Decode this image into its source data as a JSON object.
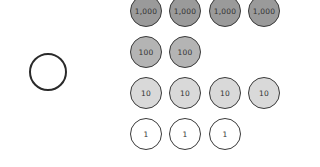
{
  "diagram": {
    "empty_circle": {
      "label": ""
    },
    "rows": [
      {
        "value": "1,000",
        "count": 4,
        "fill": "#9a9a9a"
      },
      {
        "value": "100",
        "count": 2,
        "fill": "#b4b4b4"
      },
      {
        "value": "10",
        "count": 4,
        "fill": "#d9d9d9"
      },
      {
        "value": "1",
        "count": 3,
        "fill": "#ffffff"
      }
    ],
    "coins": [
      {
        "row": 0,
        "col": 0,
        "label": "1,000"
      },
      {
        "row": 0,
        "col": 1,
        "label": "1,000"
      },
      {
        "row": 0,
        "col": 2,
        "label": "1,000"
      },
      {
        "row": 0,
        "col": 3,
        "label": "1,000"
      },
      {
        "row": 1,
        "col": 0,
        "label": "100"
      },
      {
        "row": 1,
        "col": 1,
        "label": "100"
      },
      {
        "row": 2,
        "col": 0,
        "label": "10"
      },
      {
        "row": 2,
        "col": 1,
        "label": "10"
      },
      {
        "row": 2,
        "col": 2,
        "label": "10"
      },
      {
        "row": 2,
        "col": 3,
        "label": "10"
      },
      {
        "row": 3,
        "col": 0,
        "label": "1"
      },
      {
        "row": 3,
        "col": 1,
        "label": "1"
      },
      {
        "row": 3,
        "col": 2,
        "label": "1"
      }
    ]
  }
}
